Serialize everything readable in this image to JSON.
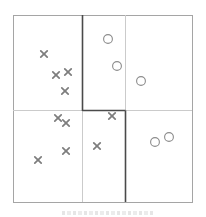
{
  "figure": {
    "background": "#ffffff",
    "border_color": "#a5a5a5",
    "faint_line_color": "#cbcbcb",
    "bold_line_color": "#4a4a4a",
    "cross_color": "#7d7d7d",
    "circle_stroke_color": "#8c8c8c",
    "circle_fill_color": "#ffffff",
    "box": {
      "x": 13,
      "y": 15,
      "width": 179,
      "height": 187
    },
    "lines": [
      {
        "x1": 13,
        "y1": 110.5,
        "x2": 192,
        "y2": 110.5,
        "weight": "faint"
      },
      {
        "x1": 125.5,
        "y1": 15,
        "x2": 125.5,
        "y2": 110.5,
        "weight": "faint"
      },
      {
        "x1": 82.5,
        "y1": 110.5,
        "x2": 82.5,
        "y2": 202,
        "weight": "faint"
      },
      {
        "x1": 82.5,
        "y1": 15,
        "x2": 82.5,
        "y2": 111,
        "weight": "bold"
      },
      {
        "x1": 82.5,
        "y1": 110.5,
        "x2": 125.5,
        "y2": 110.5,
        "weight": "bold"
      },
      {
        "x1": 125.5,
        "y1": 110.5,
        "x2": 125.5,
        "y2": 202,
        "weight": "bold"
      }
    ],
    "cross_half_size": 3.2,
    "cross_stroke_width": 1.7,
    "circle_radius": 4.4,
    "circle_stroke_width": 1.1,
    "crosses": [
      [
        44,
        54
      ],
      [
        56,
        75
      ],
      [
        68,
        72
      ],
      [
        65,
        91
      ],
      [
        58,
        118
      ],
      [
        66,
        123
      ],
      [
        112,
        116
      ],
      [
        97,
        146
      ],
      [
        66,
        151
      ],
      [
        38,
        160
      ]
    ],
    "circles": [
      [
        108,
        39
      ],
      [
        117,
        66
      ],
      [
        141,
        81
      ],
      [
        169,
        137
      ],
      [
        155,
        142
      ]
    ]
  },
  "chart_data": {
    "type": "scatter",
    "title": "",
    "xlabel": "",
    "ylabel": "",
    "xlim": [
      0,
      1
    ],
    "ylim": [
      0,
      1
    ],
    "grid": false,
    "legend": "none",
    "series": [
      {
        "name": "class-cross",
        "marker": "x",
        "color": "#7d7d7d",
        "points": [
          [
            0.173,
            0.791
          ],
          [
            0.24,
            0.679
          ],
          [
            0.307,
            0.695
          ],
          [
            0.291,
            0.594
          ],
          [
            0.251,
            0.449
          ],
          [
            0.296,
            0.422
          ],
          [
            0.553,
            0.46
          ],
          [
            0.469,
            0.299
          ],
          [
            0.296,
            0.273
          ],
          [
            0.14,
            0.225
          ]
        ]
      },
      {
        "name": "class-circle",
        "marker": "o",
        "color": "#8c8c8c",
        "points": [
          [
            0.531,
            0.872
          ],
          [
            0.581,
            0.727
          ],
          [
            0.715,
            0.647
          ],
          [
            0.872,
            0.348
          ],
          [
            0.793,
            0.321
          ]
        ]
      }
    ],
    "partitions": {
      "faint_grid": {
        "horizontal_split_y": 0.49,
        "vertical_splits_x": [
          0.386,
          0.626
        ]
      },
      "bold_boundary_path": [
        [
          0.386,
          1.0
        ],
        [
          0.386,
          0.49
        ],
        [
          0.626,
          0.49
        ],
        [
          0.626,
          0.0
        ]
      ]
    }
  }
}
